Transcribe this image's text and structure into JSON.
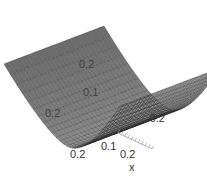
{
  "chart_data": {
    "type": "surface",
    "title": "",
    "xlabel": "x",
    "ylabel": "",
    "zlabel": "",
    "x_tick_labels": [
      "0.1",
      "0.2"
    ],
    "y_tick_labels": [
      "0.2",
      "-0.2"
    ],
    "z_tick_labels": [
      "0.2",
      "0.1"
    ],
    "front_tick_label": "0.2",
    "surface_color": "#6e6e6e",
    "mesh_color": "#2a2a2a",
    "grid": true,
    "colors": {
      "surface": "#6e6e6e",
      "mesh": "#2a2a2a",
      "text": "#333333",
      "axis": "#9a9a9a"
    }
  }
}
